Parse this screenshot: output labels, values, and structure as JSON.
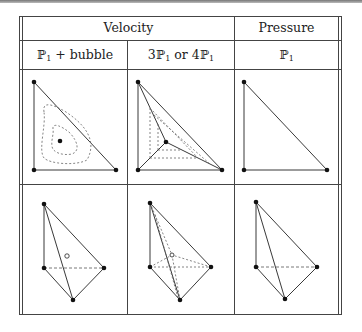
{
  "table": {
    "header_row1": {
      "velocity_label": "Velocity",
      "pressure_label": "Pressure"
    },
    "header_row2": [
      {
        "label_prefix": "ℙ",
        "sub": "1",
        "suffix": " + bubble"
      },
      {
        "label_prefix": "3ℙ",
        "sub": "1",
        "mid": " or 4ℙ",
        "sub2": "1"
      },
      {
        "label_prefix": "ℙ",
        "sub": "1"
      }
    ],
    "rows": [
      {
        "name": "2D triangles",
        "cells": [
          "P1 + bubble triangle with interior node and dashed contour lines",
          "3P1 / 4P1 triangle subdivided at interior node",
          "P1 triangle"
        ]
      },
      {
        "name": "3D tetrahedra",
        "cells": [
          "P1 + bubble tetrahedron with interior bubble node",
          "3P1 / 4P1 tetrahedron subdivided at interior node",
          "P1 tetrahedron"
        ]
      }
    ]
  },
  "colors": {
    "line": "#222222",
    "dashed": "#555555",
    "border": "#444444"
  }
}
